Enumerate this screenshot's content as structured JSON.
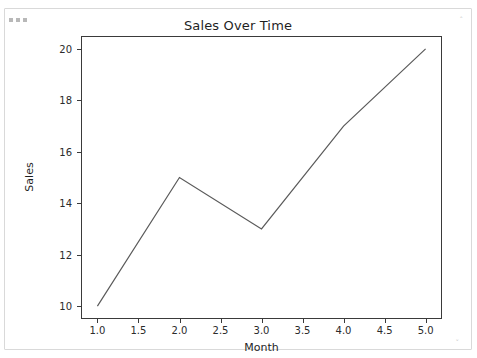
{
  "window": {
    "dots_icon": "more-dots-icon",
    "resize_handle_top_right": "˄",
    "resize_handle_bottom_right": "˅",
    "background_color": "#ffffff",
    "border_color": "#d9d9d9"
  },
  "chart_data": {
    "type": "line",
    "title": "Sales Over Time",
    "xlabel": "Month",
    "ylabel": "Sales",
    "x": [
      1,
      2,
      3,
      4,
      5
    ],
    "values": [
      10,
      15,
      13,
      17,
      20
    ],
    "series": [
      {
        "name": "Sales",
        "values": [
          10,
          15,
          13,
          17,
          20
        ]
      }
    ],
    "xlim": [
      0.8,
      5.2
    ],
    "ylim": [
      9.5,
      20.5
    ],
    "xticks": [
      1.0,
      1.5,
      2.0,
      2.5,
      3.0,
      3.5,
      4.0,
      4.5,
      5.0
    ],
    "xtick_labels": [
      "1.0",
      "1.5",
      "2.0",
      "2.5",
      "3.0",
      "3.5",
      "4.0",
      "4.5",
      "5.0"
    ],
    "yticks": [
      10,
      12,
      14,
      16,
      18,
      20
    ],
    "ytick_labels": [
      "10",
      "12",
      "14",
      "16",
      "18",
      "20"
    ],
    "grid": false,
    "legend": null,
    "line_color": "#5a5a5a",
    "line_width": 1.2,
    "markers": false,
    "axes_color": "#3a3a3a"
  }
}
